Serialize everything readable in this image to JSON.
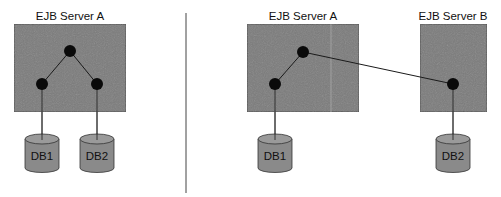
{
  "colors": {
    "server_fill": "#7b7b7b",
    "server_stroke": "#3a3a3a",
    "node_fill": "#0a0a0a",
    "edge": "#1a1a1a",
    "db_fill": "#8a8a8a",
    "db_top": "#9a9a9a",
    "divider": "#444444"
  },
  "left_diagram": {
    "server": {
      "label": "EJB Server A"
    },
    "databases": [
      {
        "label": "DB1"
      },
      {
        "label": "DB2"
      }
    ]
  },
  "right_diagram": {
    "servers": [
      {
        "label": "EJB Server A"
      },
      {
        "label": "EJB Server B"
      }
    ],
    "databases": [
      {
        "label": "DB1"
      },
      {
        "label": "DB2"
      }
    ]
  }
}
